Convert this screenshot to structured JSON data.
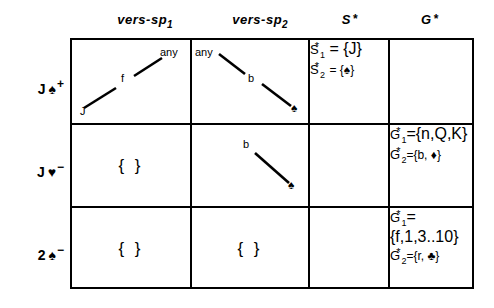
{
  "figure": {
    "columns": [
      {
        "id": "vers-sp-1",
        "label": "vers-sp",
        "subscript": "1",
        "star": ""
      },
      {
        "id": "vers-sp-2",
        "label": "vers-sp",
        "subscript": "2",
        "star": ""
      },
      {
        "id": "s-star",
        "label": "S",
        "subscript": "",
        "star": "*"
      },
      {
        "id": "g-star",
        "label": "G",
        "subscript": "",
        "star": "*"
      }
    ],
    "rows": [
      {
        "id": "row-jack-spades-plus",
        "label": {
          "rank": "J",
          "suit": "♠",
          "sign": "+"
        },
        "vers_sp_1": {
          "type": "tree",
          "nodes": [
            {
              "name": "node-any",
              "text": "any"
            },
            {
              "name": "node-f",
              "text": "f"
            },
            {
              "name": "node-j",
              "text": "J"
            }
          ]
        },
        "vers_sp_2": {
          "type": "tree",
          "nodes": [
            {
              "name": "node-any",
              "text": "any"
            },
            {
              "name": "node-b",
              "text": "b"
            },
            {
              "name": "node-spade",
              "text": "♠"
            }
          ]
        },
        "s_star": [
          {
            "base": "S",
            "sub": "1",
            "star": "*",
            "value": "= {J}"
          },
          {
            "base": "S",
            "sub": "2",
            "star": "*",
            "value": "= {♠}"
          }
        ],
        "g_star": []
      },
      {
        "id": "row-jack-hearts-minus",
        "label": {
          "rank": "J",
          "suit": "♥",
          "sign": "−"
        },
        "vers_sp_1": {
          "type": "empty",
          "text": "{ }"
        },
        "vers_sp_2": {
          "type": "tree",
          "nodes": [
            {
              "name": "node-b",
              "text": "b"
            },
            {
              "name": "node-spade",
              "text": "♠"
            }
          ]
        },
        "s_star": [],
        "g_star": [
          {
            "base": "G",
            "sub": "1",
            "star": "*",
            "value": "={n,Q,K}"
          },
          {
            "base": "G",
            "sub": "2",
            "star": "*",
            "value": "={b, ♦}"
          }
        ]
      },
      {
        "id": "row-two-spades-minus",
        "label": {
          "rank": "2",
          "suit": "♠",
          "sign": "−"
        },
        "vers_sp_1": {
          "type": "empty",
          "text": "{ }"
        },
        "vers_sp_2": {
          "type": "empty",
          "text": "{ }"
        },
        "s_star": [],
        "g_star": [
          {
            "base": "G",
            "sub": "1",
            "star": "*",
            "value": "={f,1,3..10}"
          },
          {
            "base": "G",
            "sub": "2",
            "star": "*",
            "value": "={r, ♣}"
          }
        ]
      }
    ],
    "colors": {
      "ink": "#000000",
      "background": "#ffffff"
    }
  }
}
